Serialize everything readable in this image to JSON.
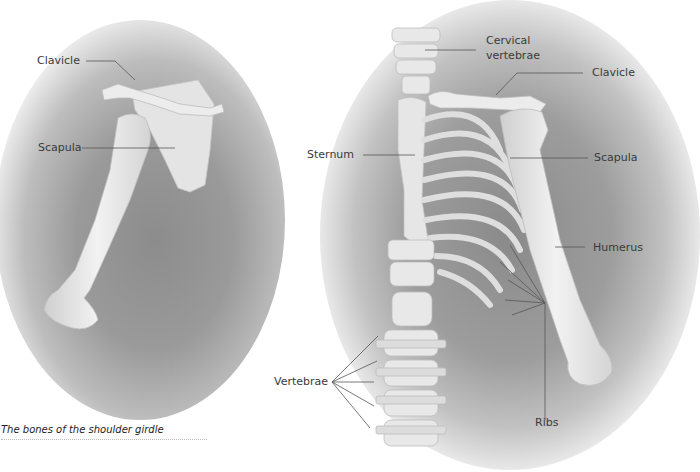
{
  "figure": {
    "caption": "The bones of the shoulder girdle",
    "left_panel": {
      "labels": {
        "clavicle": "Clavicle",
        "scapula": "Scapula"
      }
    },
    "right_panel": {
      "labels": {
        "cervical_vertebrae_line1": "Cervical",
        "cervical_vertebrae_line2": "vertebrae",
        "clavicle": "Clavicle",
        "sternum": "Sternum",
        "scapula": "Scapula",
        "humerus": "Humerus",
        "vertebrae": "Vertebrae",
        "ribs": "Ribs"
      }
    },
    "colors": {
      "background": "#ffffff",
      "bone": "#e6e6e6",
      "shadow": "#8c8c8c",
      "label_text": "#3a3a3a",
      "leader_line": "#555555"
    }
  }
}
